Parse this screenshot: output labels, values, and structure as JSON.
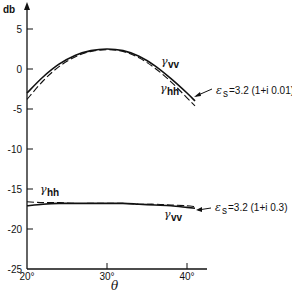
{
  "chart_data": {
    "type": "line",
    "title": "",
    "xlabel": "θ",
    "ylabel": "db",
    "xlim": [
      20,
      42
    ],
    "ylim": [
      -25,
      7
    ],
    "x_ticks": [
      "20°",
      "30°",
      "40°"
    ],
    "y_ticks": [
      "5",
      "0",
      "-5",
      "-10",
      "-15",
      "-20",
      "-25"
    ],
    "grid": false,
    "x": [
      20,
      22,
      24,
      26,
      28,
      30,
      32,
      34,
      36,
      38,
      40,
      41
    ],
    "series": [
      {
        "name": "γvv (εs = 3.2(1+i0.01))",
        "style": "solid",
        "values": [
          -3.0,
          -1.0,
          0.6,
          1.7,
          2.3,
          2.5,
          2.3,
          1.6,
          0.4,
          -1.2,
          -3.0,
          -4.0
        ]
      },
      {
        "name": "γhh (εs = 3.2(1+i0.01))",
        "style": "dashed",
        "values": [
          -3.8,
          -1.5,
          0.3,
          1.5,
          2.2,
          2.4,
          2.2,
          1.4,
          0.1,
          -1.6,
          -3.6,
          -4.6
        ]
      },
      {
        "name": "γhh (εs = 3.2(1+i0.3))",
        "style": "dashed",
        "values": [
          -16.6,
          -16.7,
          -16.7,
          -16.8,
          -16.8,
          -16.8,
          -16.8,
          -16.9,
          -16.9,
          -17.0,
          -17.1,
          -17.2
        ]
      },
      {
        "name": "γvv (εs = 3.2(1+i0.3))",
        "style": "solid",
        "values": [
          -17.1,
          -16.9,
          -16.8,
          -16.8,
          -16.8,
          -16.8,
          -16.8,
          -16.9,
          -17.0,
          -17.1,
          -17.3,
          -17.4
        ]
      }
    ],
    "annotations": [
      {
        "text": "γvv",
        "x": 34,
        "y": 1.0
      },
      {
        "text": "γhh",
        "x": 33,
        "y": -2.8
      },
      {
        "text": "εs = 3.2 (1+i 0.01)",
        "x": 42,
        "y": -2.5,
        "arrow": true
      },
      {
        "text": "γhh",
        "x": 21,
        "y": -15.5
      },
      {
        "text": "γvv",
        "x": 37,
        "y": -18.8
      },
      {
        "text": "εs = 3.2 (1+i 0.3)",
        "x": 42,
        "y": -17.3,
        "arrow": true
      }
    ]
  },
  "labels": {
    "ylabel": "db",
    "xlabel": "θ",
    "upper_vv": "γ",
    "upper_vv_sub": "vv",
    "upper_hh": "γ",
    "upper_hh_sub": "hh",
    "upper_eps": "ε",
    "upper_eps_sub": "s",
    "upper_eps_val": "=3.2 (1+i 0.01)",
    "lower_hh": "γ",
    "lower_hh_sub": "hh",
    "lower_vv": "γ",
    "lower_vv_sub": "vv",
    "lower_eps": "ε",
    "lower_eps_sub": "s",
    "lower_eps_val": "=3.2 (1+i 0.3)"
  }
}
